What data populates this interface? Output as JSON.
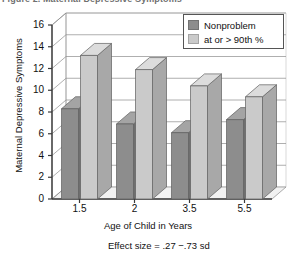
{
  "caption": {
    "fragment": "Figure 2.  Maternal Depressive Symptoms"
  },
  "chart_data": {
    "type": "bar",
    "title": "",
    "xlabel": "Age of Child in Years",
    "ylabel": "Maternal Depressive Symptoms",
    "categories": [
      "1.5",
      "2",
      "3.5",
      "5.5"
    ],
    "series": [
      {
        "name": "Nonproblem",
        "values": [
          8.3,
          6.9,
          6.1,
          7.3
        ],
        "color": "#8d8d8d"
      },
      {
        "name": "at or > 90th %",
        "values": [
          13.2,
          11.9,
          10.4,
          9.4
        ],
        "color": "#cacaca"
      }
    ],
    "ylim": [
      0,
      16
    ],
    "yticks": [
      0,
      2,
      4,
      6,
      8,
      10,
      12,
      14,
      16
    ],
    "grid": true,
    "legend_position": "top-right",
    "style": "3d-bar",
    "annotation": "Effect size = .27 −.73 sd"
  },
  "legend": {
    "items": [
      {
        "label": "Nonproblem"
      },
      {
        "label": "at or > 90th %"
      }
    ]
  },
  "colors": {
    "series_dark": "#8d8d8d",
    "series_dark_side": "#6f6f6f",
    "series_dark_top": "#a4a4a4",
    "series_light": "#cacaca",
    "series_light_side": "#a8a8a8",
    "series_light_top": "#dcdcdc",
    "axis": "#3a3a3a",
    "grid": "#9a9a9a",
    "floor": "#f2f2f2"
  }
}
